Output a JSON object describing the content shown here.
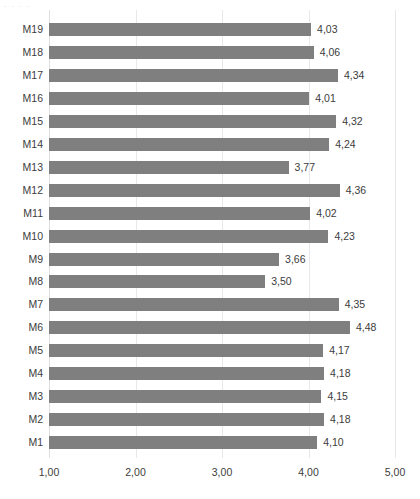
{
  "title_remnant": ". .    .      .",
  "axis": {
    "tick_labels": [
      "1,00",
      "2,00",
      "3,00",
      "4,00",
      "5,00"
    ],
    "tick_values": [
      1,
      2,
      3,
      4,
      5
    ]
  },
  "style": {
    "bar_color": "#7f7f7f",
    "gridline_color": "#e8e8ea",
    "text_color": "#3c3c3c",
    "background": "#ffffff"
  },
  "chart_data": {
    "type": "bar",
    "orientation": "horizontal",
    "title": "",
    "xlabel": "",
    "ylabel": "",
    "xlim": [
      1,
      5
    ],
    "grid": true,
    "legend": "none",
    "decimal_separator": ",",
    "categories": [
      "M19",
      "M18",
      "M17",
      "M16",
      "M15",
      "M14",
      "M13",
      "M12",
      "M11",
      "M10",
      "M9",
      "M8",
      "M7",
      "M6",
      "M5",
      "M4",
      "M3",
      "M2",
      "M1"
    ],
    "values": [
      4.03,
      4.06,
      4.34,
      4.01,
      4.32,
      4.24,
      3.77,
      4.36,
      4.02,
      4.23,
      3.66,
      3.5,
      4.35,
      4.48,
      4.17,
      4.18,
      4.15,
      4.18,
      4.1
    ],
    "data_labels": [
      "4,03",
      "4,06",
      "4,34",
      "4,01",
      "4,32",
      "4,24",
      "3,77",
      "4,36",
      "4,02",
      "4,23",
      "3,66",
      "3,50",
      "4,35",
      "4,48",
      "4,17",
      "4,18",
      "4,15",
      "4,18",
      "4,10"
    ]
  }
}
